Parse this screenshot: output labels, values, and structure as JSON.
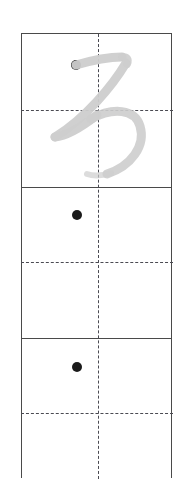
{
  "worksheet": {
    "type": "handwriting-practice-grid",
    "title": "Cursive letter tracing practice grid",
    "letter": "z",
    "script_style": "cursive",
    "canvas": {
      "width": 191,
      "height": 468,
      "background": "#ffffff"
    },
    "grid": {
      "x": 21,
      "y": 33,
      "width": 151,
      "row_count": 3,
      "row_height": 152,
      "border_color": "#4a4a4a",
      "guide_color": "#4a4a52",
      "guide_style": "dashed",
      "bottom_row_cropped": true
    },
    "rows": [
      {
        "index": 1,
        "label": "row-1-model",
        "top": 33,
        "height": 153,
        "midline_y": 110,
        "has_model_letter": true,
        "has_start_dot": true,
        "start_dot": {
          "cx": 76,
          "cy": 65,
          "r": 5,
          "color": "#1b1b1b"
        }
      },
      {
        "index": 2,
        "label": "row-2-practice",
        "top": 186,
        "height": 151,
        "midline_y": 261,
        "has_model_letter": false,
        "has_start_dot": true,
        "start_dot": {
          "cx": 77,
          "cy": 215,
          "r": 5,
          "color": "#1b1b1b"
        }
      },
      {
        "index": 3,
        "label": "row-3-practice",
        "top": 337,
        "height": 131,
        "midline_y": 412,
        "has_model_letter": false,
        "has_start_dot": true,
        "start_dot": {
          "cx": 77,
          "cy": 367,
          "r": 5,
          "color": "#1b1b1b"
        }
      }
    ],
    "center_line": {
      "label": "vertical-center-guide",
      "x": 97,
      "from_y": 33,
      "to_y": 468,
      "style": "dashed",
      "color": "#4a4a52"
    },
    "model_letter": {
      "glyph": "z",
      "stroke_color": "#cdcdcd",
      "stroke_width": 9,
      "description": "light grey cursive lowercase z with descender loop"
    }
  }
}
